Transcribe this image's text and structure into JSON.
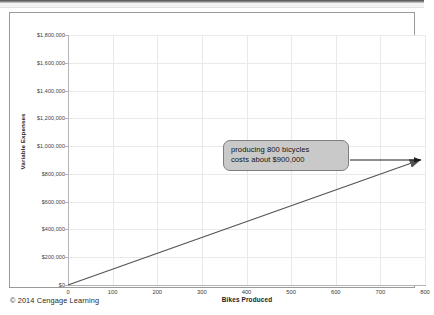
{
  "figure": {
    "footer_credit": "© 2014 Cengage Learning"
  },
  "callout": {
    "line1": "producing 800 bicycles",
    "line2": "costs about $900,000"
  },
  "chart_data": {
    "type": "line",
    "title": "",
    "xlabel": "Bikes Produced",
    "ylabel": "Variable Expenses",
    "xlim": [
      0,
      800
    ],
    "ylim": [
      0,
      1800000
    ],
    "xticks": [
      0,
      100,
      200,
      300,
      400,
      500,
      600,
      700,
      800
    ],
    "xtick_labels": [
      "0",
      "100",
      "200",
      "300",
      "400",
      "500",
      "600",
      "700",
      "800"
    ],
    "yticks": [
      0,
      200000,
      400000,
      600000,
      800000,
      1000000,
      1200000,
      1400000,
      1600000,
      1800000
    ],
    "ytick_labels": [
      "$0",
      "$200,000",
      "$400,000",
      "$600,000",
      "$800,000",
      "$1,000,000",
      "$1,200,000",
      "$1,400,000",
      "$1,600,000",
      "$1,800,000"
    ],
    "grid": true,
    "legend": "none",
    "series": [
      {
        "name": "Variable Expenses",
        "x": [
          0,
          800
        ],
        "values": [
          0,
          900000
        ],
        "color": "#555555"
      }
    ],
    "annotations": [
      {
        "text": "producing 800 bicycles costs about $900,000",
        "x": 800,
        "y": 900000
      }
    ]
  }
}
